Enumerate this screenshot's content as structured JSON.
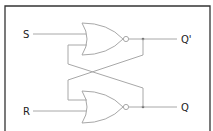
{
  "diagram": {
    "labels": {
      "s": "S",
      "r": "R",
      "q_bar": "Q'",
      "q": "Q"
    },
    "gates": [
      {
        "type": "NOR",
        "inputs": [
          "S",
          "Q"
        ],
        "output": "Q'"
      },
      {
        "type": "NOR",
        "inputs": [
          "Q'",
          "R"
        ],
        "output": "Q"
      }
    ],
    "colors": {
      "wire": "#a8a8a8",
      "frame": "#333333",
      "text": "#222222"
    }
  }
}
